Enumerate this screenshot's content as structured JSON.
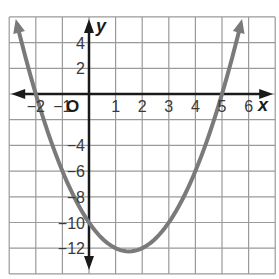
{
  "chart_data": {
    "type": "line",
    "title": "",
    "xlabel": "x",
    "ylabel": "y",
    "origin_label": "O",
    "xlim": [
      -3,
      7
    ],
    "ylim": [
      -14,
      6
    ],
    "grid": true,
    "x_ticks": [
      -2,
      -1,
      1,
      2,
      3,
      4,
      5,
      6
    ],
    "x_tick_labels": [
      "−2",
      "−1",
      "1",
      "2",
      "3",
      "4",
      "5",
      "6"
    ],
    "y_ticks": [
      4,
      2,
      -4,
      -6,
      -8,
      -10,
      -12
    ],
    "y_tick_labels": [
      "4",
      "2",
      "−4",
      "−6",
      "−8",
      "−10",
      "−12"
    ],
    "series": [
      {
        "name": "parabola",
        "equation": "y = x^2 - 3x - 10",
        "color": "#7a7a7a",
        "x": [
          -2.7,
          -2,
          -1,
          0,
          1,
          1.5,
          2,
          3,
          4,
          5,
          5.7
        ],
        "y": [
          6.4,
          0,
          -6,
          -10,
          -12,
          -12.25,
          -12,
          -10,
          -6,
          0,
          6.4
        ],
        "roots": [
          -2,
          5
        ],
        "y_intercept": -10,
        "vertex": [
          1.5,
          -12.25
        ]
      }
    ]
  },
  "style": {
    "grid_color": "#9a9a9a",
    "axis_color": "#1a1a1a",
    "curve_color": "#7a7a7a"
  }
}
